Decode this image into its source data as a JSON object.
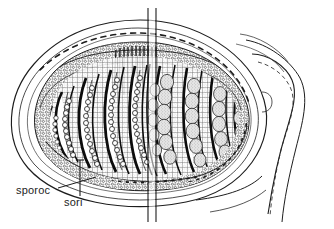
{
  "figure": {
    "kind": "scientific-line-drawing",
    "background_color": "#ffffff",
    "ink_color": "#1d1d1d",
    "width": 334,
    "height": 229
  },
  "labels": [
    {
      "id": "sporoc",
      "text": "sporoc",
      "x": 16,
      "y": 185,
      "leader_from": [
        66,
        189
      ],
      "leader_to": [
        96,
        178
      ]
    },
    {
      "id": "sori",
      "text": "sori",
      "x": 64,
      "y": 197,
      "leader_from": [
        80,
        196
      ],
      "leader_to": [
        80,
        163
      ]
    }
  ],
  "structures": {
    "outer_wall_label": "sporocarp wall",
    "left_half_label": "microsporangia sori",
    "right_half_label": "megasporangia sori",
    "stalk_label": "pedicel",
    "center_break_label": "section break line"
  },
  "drawing": {
    "body": {
      "cx": 140,
      "cy": 112,
      "rx": 130,
      "ry": 92
    },
    "left_sori": {
      "count": 6,
      "sporangia_per_sorus": 13,
      "sporangium_radius": 2.5,
      "fill": "#ffffff"
    },
    "right_sori": {
      "count": 5,
      "sporangia_per_sorus": 7,
      "sporangium_rx": 7,
      "sporangium_ry": 8,
      "fill": "#e2e2e2"
    },
    "break_line": {
      "x_left": 148,
      "x_right": 156,
      "y_top": 8,
      "y_bottom": 222
    }
  }
}
